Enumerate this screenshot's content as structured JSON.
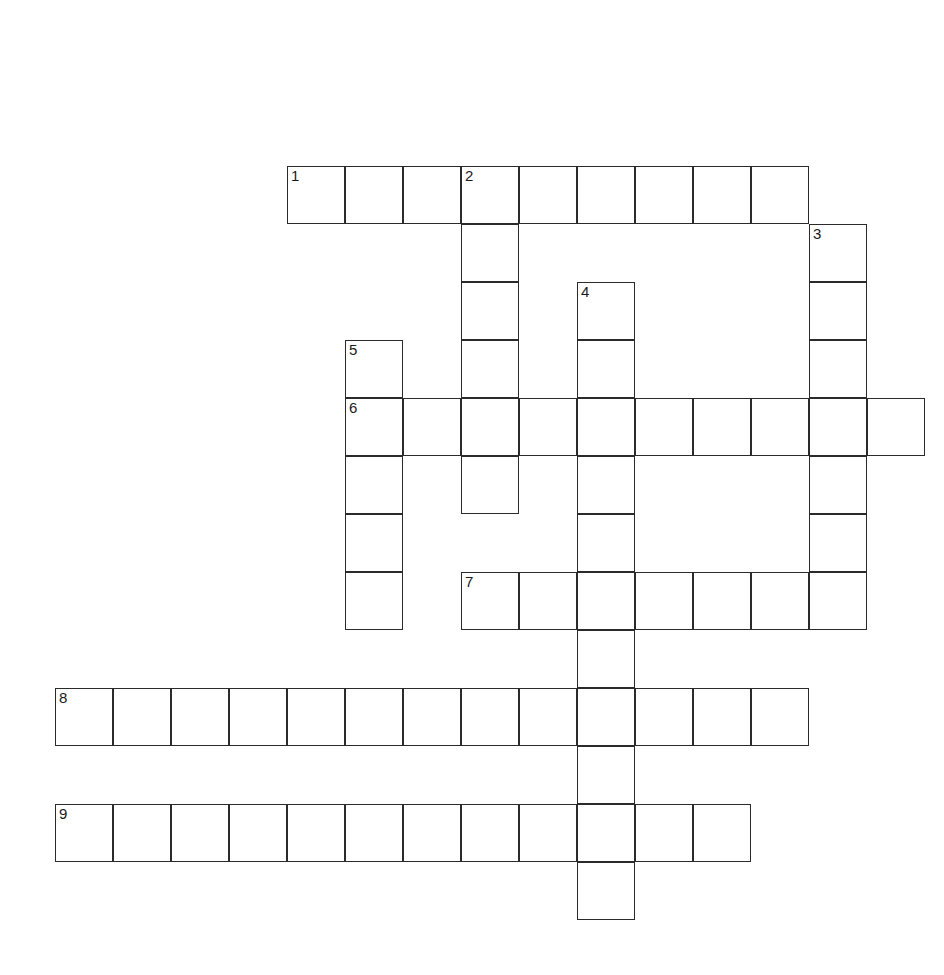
{
  "page": {
    "background_color": "#ffffff",
    "width": 944,
    "height": 975
  },
  "grid": {
    "cell_size": 58,
    "origin_x": 55,
    "origin_y": 166,
    "columns": 15,
    "rows": 14,
    "line_color": "#2b2b2b",
    "line_width": 1.6,
    "cell_fill": "#ffffff",
    "number_color": "#1a1a1a",
    "number_font_size": 15
  },
  "entries": [
    {
      "number": "1",
      "direction": "across",
      "start_col": 4,
      "start_row": 0,
      "length": 9,
      "answer": ""
    },
    {
      "number": "2",
      "direction": "down",
      "start_col": 7,
      "start_row": 0,
      "length": 6,
      "answer": ""
    },
    {
      "number": "3",
      "direction": "down",
      "start_col": 13,
      "start_row": 1,
      "length": 7,
      "answer": ""
    },
    {
      "number": "4",
      "direction": "down",
      "start_col": 9,
      "start_row": 2,
      "length": 11,
      "answer": ""
    },
    {
      "number": "5",
      "direction": "down",
      "start_col": 5,
      "start_row": 3,
      "length": 5,
      "answer": ""
    },
    {
      "number": "6",
      "direction": "across",
      "start_col": 5,
      "start_row": 4,
      "length": 10,
      "answer": ""
    },
    {
      "number": "7",
      "direction": "across",
      "start_col": 7,
      "start_row": 7,
      "length": 7,
      "answer": ""
    },
    {
      "number": "8",
      "direction": "across",
      "start_col": 0,
      "start_row": 9,
      "length": 13,
      "answer": ""
    },
    {
      "number": "9",
      "direction": "across",
      "start_col": 0,
      "start_row": 11,
      "length": 12,
      "answer": ""
    }
  ],
  "numbered_cells": [
    {
      "label": "1",
      "col": 4,
      "row": 0
    },
    {
      "label": "2",
      "col": 7,
      "row": 0
    },
    {
      "label": "3",
      "col": 13,
      "row": 1
    },
    {
      "label": "4",
      "col": 9,
      "row": 2
    },
    {
      "label": "5",
      "col": 5,
      "row": 3
    },
    {
      "label": "6",
      "col": 5,
      "row": 4
    },
    {
      "label": "7",
      "col": 7,
      "row": 7
    },
    {
      "label": "8",
      "col": 0,
      "row": 9
    },
    {
      "label": "9",
      "col": 0,
      "row": 11
    }
  ],
  "cells": [
    {
      "col": 4,
      "row": 0
    },
    {
      "col": 5,
      "row": 0
    },
    {
      "col": 6,
      "row": 0
    },
    {
      "col": 7,
      "row": 0
    },
    {
      "col": 8,
      "row": 0
    },
    {
      "col": 9,
      "row": 0
    },
    {
      "col": 10,
      "row": 0
    },
    {
      "col": 11,
      "row": 0
    },
    {
      "col": 12,
      "row": 0
    },
    {
      "col": 7,
      "row": 1
    },
    {
      "col": 13,
      "row": 1
    },
    {
      "col": 7,
      "row": 2
    },
    {
      "col": 9,
      "row": 2
    },
    {
      "col": 13,
      "row": 2
    },
    {
      "col": 5,
      "row": 3
    },
    {
      "col": 7,
      "row": 3
    },
    {
      "col": 9,
      "row": 3
    },
    {
      "col": 13,
      "row": 3
    },
    {
      "col": 5,
      "row": 4
    },
    {
      "col": 6,
      "row": 4
    },
    {
      "col": 7,
      "row": 4
    },
    {
      "col": 8,
      "row": 4
    },
    {
      "col": 9,
      "row": 4
    },
    {
      "col": 10,
      "row": 4
    },
    {
      "col": 11,
      "row": 4
    },
    {
      "col": 12,
      "row": 4
    },
    {
      "col": 13,
      "row": 4
    },
    {
      "col": 14,
      "row": 4
    },
    {
      "col": 5,
      "row": 5
    },
    {
      "col": 7,
      "row": 5
    },
    {
      "col": 9,
      "row": 5
    },
    {
      "col": 13,
      "row": 5
    },
    {
      "col": 5,
      "row": 6
    },
    {
      "col": 9,
      "row": 6
    },
    {
      "col": 13,
      "row": 6
    },
    {
      "col": 5,
      "row": 7
    },
    {
      "col": 7,
      "row": 7
    },
    {
      "col": 8,
      "row": 7
    },
    {
      "col": 9,
      "row": 7
    },
    {
      "col": 10,
      "row": 7
    },
    {
      "col": 11,
      "row": 7
    },
    {
      "col": 12,
      "row": 7
    },
    {
      "col": 13,
      "row": 7
    },
    {
      "col": 9,
      "row": 8
    },
    {
      "col": 0,
      "row": 9
    },
    {
      "col": 1,
      "row": 9
    },
    {
      "col": 2,
      "row": 9
    },
    {
      "col": 3,
      "row": 9
    },
    {
      "col": 4,
      "row": 9
    },
    {
      "col": 5,
      "row": 9
    },
    {
      "col": 6,
      "row": 9
    },
    {
      "col": 7,
      "row": 9
    },
    {
      "col": 8,
      "row": 9
    },
    {
      "col": 9,
      "row": 9
    },
    {
      "col": 10,
      "row": 9
    },
    {
      "col": 11,
      "row": 9
    },
    {
      "col": 12,
      "row": 9
    },
    {
      "col": 9,
      "row": 10
    },
    {
      "col": 0,
      "row": 11
    },
    {
      "col": 1,
      "row": 11
    },
    {
      "col": 2,
      "row": 11
    },
    {
      "col": 3,
      "row": 11
    },
    {
      "col": 4,
      "row": 11
    },
    {
      "col": 5,
      "row": 11
    },
    {
      "col": 6,
      "row": 11
    },
    {
      "col": 7,
      "row": 11
    },
    {
      "col": 8,
      "row": 11
    },
    {
      "col": 9,
      "row": 11
    },
    {
      "col": 10,
      "row": 11
    },
    {
      "col": 11,
      "row": 11
    },
    {
      "col": 9,
      "row": 12
    }
  ]
}
